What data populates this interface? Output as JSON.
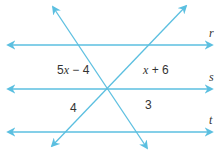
{
  "diagram": {
    "line_color": "#5bbfe0",
    "text_color": "#333333",
    "parallel_lines": [
      {
        "name": "r",
        "label": "r",
        "y": 45,
        "x1": 8,
        "x2": 212,
        "label_x": 209,
        "label_y": 37
      },
      {
        "name": "s",
        "label": "s",
        "y": 89,
        "x1": 8,
        "x2": 212,
        "label_x": 209,
        "label_y": 81
      },
      {
        "name": "t",
        "label": "t",
        "y": 132,
        "x1": 8,
        "x2": 212,
        "label_x": 209,
        "label_y": 124
      }
    ],
    "transversals": [
      {
        "name": "transversal-1",
        "x1": 53,
        "y1": 7,
        "x2": 147,
        "y2": 148
      },
      {
        "name": "transversal-2",
        "x1": 186,
        "y1": 6,
        "x2": 52,
        "y2": 146
      }
    ],
    "intersection": {
      "x": 107,
      "y": 89
    },
    "angle_labels": [
      {
        "name": "angle-upper-left",
        "text": "5x − 4",
        "var": "x",
        "coef": "5",
        "rest": " − 4",
        "x": 57,
        "y": 74
      },
      {
        "name": "angle-upper-right",
        "text": "x + 6",
        "var": "x",
        "coef": "",
        "rest": " + 6",
        "x": 143,
        "y": 74
      },
      {
        "name": "angle-lower-left",
        "text": "4",
        "x": 70,
        "y": 112
      },
      {
        "name": "angle-lower-right",
        "text": "3",
        "x": 145,
        "y": 109
      }
    ]
  }
}
